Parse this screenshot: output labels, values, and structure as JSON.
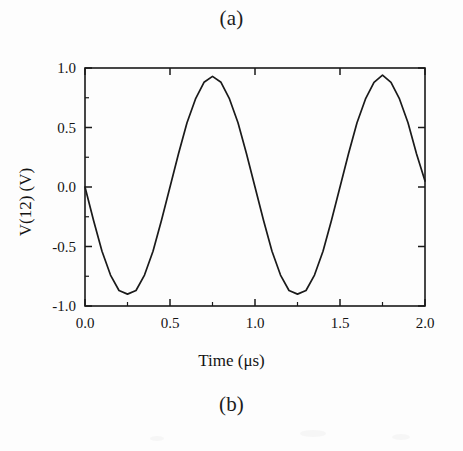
{
  "figure": {
    "caption_top": "(a)",
    "caption_bottom": "(b)"
  },
  "chart_data": {
    "type": "line",
    "title": "",
    "xlabel": "Time (μs)",
    "ylabel": "V(12) (V)",
    "xlim": [
      0.0,
      2.0
    ],
    "ylim": [
      -1.0,
      1.0
    ],
    "xticks": [
      0.0,
      0.5,
      1.0,
      1.5,
      2.0
    ],
    "xtick_labels": [
      "0.0",
      "0.5",
      "1.0",
      "1.5",
      "2.0"
    ],
    "yticks": [
      -1.0,
      -0.5,
      0.0,
      0.5,
      1.0
    ],
    "ytick_labels": [
      "-1.0",
      "-0.5",
      "0.0",
      "0.5",
      "1.0"
    ],
    "x_minor_ticks": [
      0.25,
      0.75,
      1.25,
      1.75
    ],
    "y_minor_ticks": [
      -0.75,
      -0.25,
      0.25,
      0.75
    ],
    "grid": false,
    "legend": null,
    "tick_direction": "in",
    "line_color": "#1a1a1a",
    "series": [
      {
        "name": "V(12)",
        "amplitude": 0.92,
        "period_us": 1.0,
        "phase": "negative-sine",
        "x": [
          0.0,
          0.05,
          0.1,
          0.15,
          0.2,
          0.25,
          0.3,
          0.35,
          0.4,
          0.45,
          0.5,
          0.55,
          0.6,
          0.65,
          0.7,
          0.75,
          0.8,
          0.85,
          0.9,
          0.95,
          1.0,
          1.05,
          1.1,
          1.15,
          1.2,
          1.25,
          1.3,
          1.35,
          1.4,
          1.45,
          1.5,
          1.55,
          1.6,
          1.65,
          1.7,
          1.75,
          1.8,
          1.85,
          1.9,
          1.95,
          2.0
        ],
        "y": [
          0.0,
          -0.28,
          -0.54,
          -0.74,
          -0.87,
          -0.9,
          -0.87,
          -0.74,
          -0.54,
          -0.28,
          0.0,
          0.28,
          0.54,
          0.74,
          0.88,
          0.93,
          0.88,
          0.74,
          0.54,
          0.28,
          0.0,
          -0.28,
          -0.54,
          -0.74,
          -0.87,
          -0.9,
          -0.87,
          -0.74,
          -0.54,
          -0.28,
          0.0,
          0.28,
          0.54,
          0.74,
          0.88,
          0.94,
          0.88,
          0.74,
          0.54,
          0.28,
          0.05
        ]
      }
    ]
  }
}
